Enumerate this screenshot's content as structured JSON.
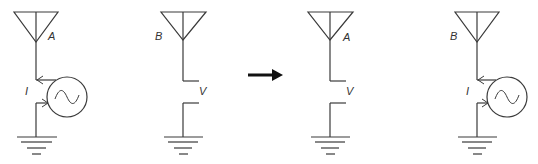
{
  "diagram": {
    "colors": {
      "stroke": "#3a3a3a",
      "arrow": "#111111",
      "background": "#ffffff"
    },
    "panels": [
      {
        "id": "panel-1",
        "antenna_label": "A",
        "element": "current-source",
        "element_label": "I"
      },
      {
        "id": "panel-2",
        "antenna_label": "B",
        "element": "open-terminals",
        "element_label": "V"
      },
      {
        "id": "panel-3",
        "antenna_label": "A",
        "element": "open-terminals",
        "element_label": "V"
      },
      {
        "id": "panel-4",
        "antenna_label": "B",
        "element": "current-source",
        "element_label": "I"
      }
    ],
    "transition_arrow": "right-arrow"
  }
}
